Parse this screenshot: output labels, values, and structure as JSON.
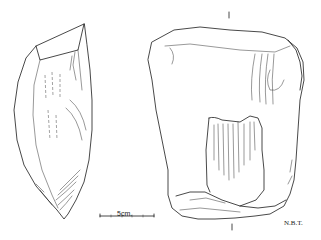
{
  "figure": {
    "type": "lithic illustration",
    "views": [
      "side-view",
      "front-view"
    ],
    "scale_bar": {
      "label": "5cm.",
      "length_cm": 5
    },
    "illustrator_initials": "N.B.T.",
    "section_marks": [
      "I",
      "I"
    ]
  }
}
